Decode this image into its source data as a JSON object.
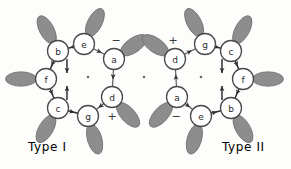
{
  "figure": {
    "background_color": "#fdfdfc",
    "lobe_color": "#8d8d8d",
    "node_fill": "#ffffff",
    "node_stroke": "#4a4a4a",
    "edge_color": "#555555",
    "arrow_color": "#2e2e2e"
  },
  "captions": {
    "left": "Type I",
    "right": "Type II"
  },
  "structures": [
    {
      "id": "type-I",
      "label": "Type I",
      "center": {
        "cx": 88,
        "cy": 77,
        "dot": "center-dot"
      },
      "signs": [
        {
          "symbol": "−",
          "x": 116,
          "y": 40,
          "near": "e"
        },
        {
          "symbol": "+",
          "x": 112,
          "y": 116,
          "near": "g"
        }
      ],
      "nodes": [
        {
          "label": "e",
          "cx": 84,
          "cy": 44,
          "r": 10.5,
          "lobe_angle": -63,
          "lobe_dist": 24
        },
        {
          "label": "b",
          "cx": 58,
          "cy": 51,
          "r": 10.5,
          "lobe_angle": -118,
          "lobe_dist": 24
        },
        {
          "label": "f",
          "cx": 46,
          "cy": 79,
          "r": 10.5,
          "lobe_angle": 180,
          "lobe_dist": 25
        },
        {
          "label": "c",
          "cx": 58,
          "cy": 108,
          "r": 10.5,
          "lobe_angle": 120,
          "lobe_dist": 24
        },
        {
          "label": "g",
          "cx": 88,
          "cy": 116,
          "r": 10.5,
          "lobe_angle": 74,
          "lobe_dist": 24
        },
        {
          "label": "d",
          "cx": 112,
          "cy": 97,
          "r": 10.5,
          "lobe_angle": 48,
          "lobe_dist": 24
        },
        {
          "label": "a",
          "cx": 114,
          "cy": 59,
          "r": 10.5,
          "lobe_angle": -35,
          "lobe_dist": 24
        }
      ],
      "edges": [
        {
          "from": "b",
          "to": "f",
          "arrow_at": 0.62,
          "style": "dark"
        },
        {
          "from": "e",
          "to": "b",
          "arrow_at": 0.7,
          "style": "dark"
        },
        {
          "from": "f",
          "to": "c",
          "arrow_at": 0.62,
          "style": "dark"
        },
        {
          "from": "c",
          "to": "g",
          "arrow_at": 0.66,
          "style": "dark"
        },
        {
          "from": "d",
          "to": "g",
          "arrow_at": 0.7,
          "style": "light"
        },
        {
          "from": "a",
          "to": "d",
          "arrow_at": 0.58,
          "style": "light"
        },
        {
          "from": "e",
          "to": "a",
          "arrow_at": 0.74,
          "style": "light"
        }
      ],
      "inner_arrows": [
        {
          "x": 67,
          "y": 66,
          "dir": "down"
        },
        {
          "x": 67,
          "y": 93,
          "dir": "up"
        }
      ]
    },
    {
      "id": "type-II",
      "label": "Type II",
      "center": {
        "cx": 201,
        "cy": 77,
        "dot": "center-dot"
      },
      "signs": [
        {
          "symbol": "+",
          "x": 173,
          "y": 40,
          "near": "g"
        },
        {
          "symbol": "−",
          "x": 176,
          "y": 116,
          "near": "e"
        }
      ],
      "nodes": [
        {
          "label": "g",
          "cx": 205,
          "cy": 44,
          "r": 10.5,
          "lobe_angle": -117,
          "lobe_dist": 24
        },
        {
          "label": "c",
          "cx": 231,
          "cy": 51,
          "r": 10.5,
          "lobe_angle": -62,
          "lobe_dist": 24
        },
        {
          "label": "f",
          "cx": 243,
          "cy": 79,
          "r": 10.5,
          "lobe_angle": 0,
          "lobe_dist": 25
        },
        {
          "label": "b",
          "cx": 231,
          "cy": 108,
          "r": 10.5,
          "lobe_angle": 60,
          "lobe_dist": 24
        },
        {
          "label": "e",
          "cx": 201,
          "cy": 116,
          "r": 10.5,
          "lobe_angle": 106,
          "lobe_dist": 24
        },
        {
          "label": "a",
          "cx": 177,
          "cy": 97,
          "r": 10.5,
          "lobe_angle": 132,
          "lobe_dist": 24
        },
        {
          "label": "d",
          "cx": 175,
          "cy": 59,
          "r": 10.5,
          "lobe_angle": -145,
          "lobe_dist": 24
        }
      ],
      "edges": [
        {
          "from": "g",
          "to": "c",
          "arrow_at": 0.7,
          "style": "dark"
        },
        {
          "from": "c",
          "to": "f",
          "arrow_at": 0.68,
          "style": "dark"
        },
        {
          "from": "f",
          "to": "b",
          "arrow_at": 0.62,
          "style": "dark"
        },
        {
          "from": "e",
          "to": "b",
          "arrow_at": 0.6,
          "style": "dark"
        },
        {
          "from": "d",
          "to": "g",
          "arrow_at": 0.66,
          "style": "light"
        },
        {
          "from": "a",
          "to": "d",
          "arrow_at": 0.7,
          "style": "light"
        },
        {
          "from": "a",
          "to": "e",
          "arrow_at": 0.62,
          "style": "light"
        }
      ],
      "inner_arrows": [
        {
          "x": 222,
          "y": 66,
          "dir": "down"
        },
        {
          "x": 222,
          "y": 93,
          "dir": "up"
        }
      ]
    }
  ],
  "extra_dots": [
    {
      "cx": 144,
      "cy": 77
    }
  ]
}
